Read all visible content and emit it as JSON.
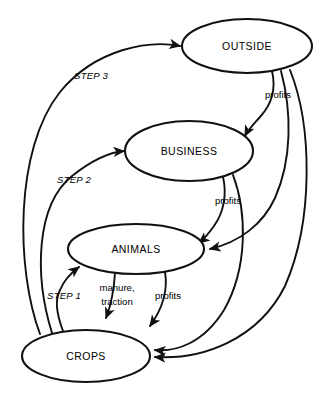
{
  "diagram": {
    "type": "cycle-flow-diagram",
    "background_color": "#ffffff",
    "stroke_color": "#111111",
    "nodes": [
      {
        "id": "outside",
        "label": "OUTSIDE",
        "cx": 247,
        "cy": 46,
        "rx": 65,
        "ry": 27
      },
      {
        "id": "business",
        "label": "BUSINESS",
        "cx": 189,
        "cy": 151,
        "rx": 64,
        "ry": 30
      },
      {
        "id": "animals",
        "label": "ANIMALS",
        "cx": 136,
        "cy": 249,
        "rx": 68,
        "ry": 25
      },
      {
        "id": "crops",
        "label": "CROPS",
        "cx": 86,
        "cy": 356,
        "rx": 64,
        "ry": 26
      }
    ],
    "edges": [
      {
        "id": "crops-to-animals",
        "from": "crops",
        "to": "animals",
        "label": "STEP 1",
        "label_style": "italic"
      },
      {
        "id": "crops-to-business",
        "from": "crops",
        "to": "business",
        "label": "STEP 2",
        "label_style": "italic"
      },
      {
        "id": "crops-to-outside",
        "from": "crops",
        "to": "outside",
        "label": "STEP 3",
        "label_style": "italic"
      },
      {
        "id": "outside-to-business",
        "from": "outside",
        "to": "business",
        "label": "profits",
        "label_style": "normal"
      },
      {
        "id": "outside-to-animals",
        "from": "outside",
        "to": "animals",
        "label": "",
        "label_style": "normal"
      },
      {
        "id": "outside-to-crops",
        "from": "outside",
        "to": "crops",
        "label": "",
        "label_style": "normal"
      },
      {
        "id": "business-to-animals",
        "from": "business",
        "to": "animals",
        "label": "profits",
        "label_style": "normal"
      },
      {
        "id": "business-to-crops",
        "from": "business",
        "to": "crops",
        "label": "",
        "label_style": "normal"
      },
      {
        "id": "animals-to-crops-a",
        "from": "animals",
        "to": "crops",
        "label": "manure, traction",
        "label_style": "normal"
      },
      {
        "id": "animals-to-crops-b",
        "from": "animals",
        "to": "crops",
        "label": "profits",
        "label_style": "normal"
      }
    ],
    "labels": {
      "step1": "STEP 1",
      "step2": "STEP 2",
      "step3": "STEP 3",
      "profits_outside_business": "profits",
      "profits_business_animals": "profits",
      "profits_animals_crops": "profits",
      "manure_line1": "manure,",
      "manure_line2": "traction"
    }
  }
}
